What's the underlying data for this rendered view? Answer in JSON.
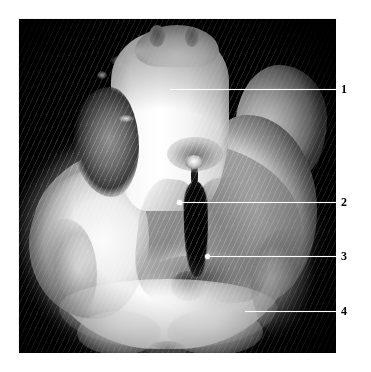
{
  "figure": {
    "kind": "anatomical-specimen-photograph",
    "plate_background_color": "#000000",
    "page_background_color": "#ffffff",
    "leader_line_color": "#ffffff",
    "callout_text_color": "#000000"
  },
  "callouts": [
    {
      "number": "1",
      "label_x": 341,
      "label_y": 83,
      "line_y": 89,
      "line_start_x": 170,
      "line_end_x": 337,
      "has_dot": false
    },
    {
      "number": "2",
      "label_x": 341,
      "label_y": 196,
      "line_y": 202,
      "line_start_x": 179,
      "line_end_x": 337,
      "has_dot": true,
      "dot_x": 179,
      "dot_y": 202
    },
    {
      "number": "3",
      "number_alt": "3",
      "label_x": 341,
      "label_y": 250,
      "line_y": 256,
      "line_start_x": 207,
      "line_end_x": 337,
      "has_dot": true,
      "dot_x": 207,
      "dot_y": 256
    },
    {
      "number": "4",
      "label_x": 341,
      "label_y": 305,
      "line_y": 311,
      "line_start_x": 245,
      "line_end_x": 337,
      "has_dot": false
    }
  ]
}
